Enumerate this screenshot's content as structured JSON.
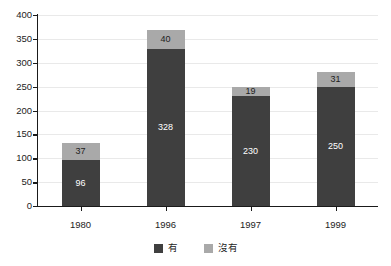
{
  "chart_data": {
    "type": "bar",
    "subtype": "stacked-bar",
    "title": "",
    "xlabel": "",
    "ylabel": "",
    "categories": [
      "1980",
      "1996",
      "1997",
      "1999"
    ],
    "series": [
      {
        "name": "有",
        "color": "#3f3f3f",
        "values": [
          96,
          328,
          230,
          250
        ]
      },
      {
        "name": "沒有",
        "color": "#a9a9a9",
        "values": [
          37,
          40,
          19,
          31
        ]
      }
    ],
    "totals": [
      133,
      368,
      249,
      281
    ],
    "ylim": [
      0,
      400
    ],
    "yticks": [
      0,
      50,
      100,
      150,
      200,
      250,
      300,
      350,
      400
    ],
    "ytick_labels": [
      "0",
      "50",
      "100",
      "150",
      "200",
      "250",
      "300",
      "350",
      "400"
    ],
    "grid": true,
    "grid_axis": "y",
    "legend_position": "bottom-center",
    "data_labels": true
  },
  "legend": {
    "items": [
      {
        "label": "有",
        "color": "#3f3f3f"
      },
      {
        "label": "沒有",
        "color": "#a9a9a9"
      }
    ]
  },
  "colors": {
    "series_main": "#3f3f3f",
    "series_sub": "#a9a9a9",
    "axis": "#1a1a1a",
    "grid": "#e9e9e9",
    "background": "#ffffff",
    "tick_text": "#232323"
  }
}
